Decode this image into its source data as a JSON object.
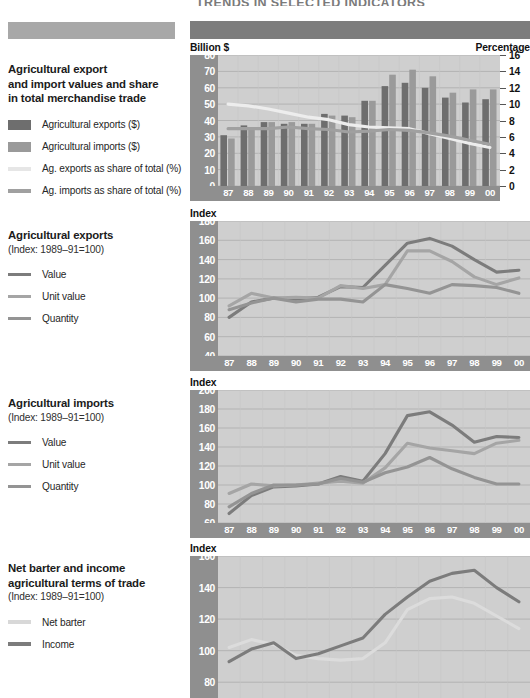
{
  "header": {
    "title": "TRENDS IN SELECTED INDICATORS"
  },
  "sections": [
    {
      "id": "trade-values",
      "title_lines": [
        "Agricultural export",
        "and import values and share",
        "in total merchandise trade"
      ],
      "subtitle": "",
      "legend": [
        {
          "label": "Agricultural exports ($)",
          "type": "box",
          "color": "#6e6e6e"
        },
        {
          "label": "Agricultural imports ($)",
          "type": "box",
          "color": "#9a9a9a"
        },
        {
          "label": "Ag. exports as share of total (%)",
          "type": "line",
          "color": "#e6e6e6"
        },
        {
          "label": "Ag. imports as share of total (%)",
          "type": "line",
          "color": "#a0a0a0"
        }
      ],
      "left_axis_caption": "Billion $",
      "right_axis_caption": "Percentage"
    },
    {
      "id": "ag-exports",
      "title_lines": [
        "Agricultural exports"
      ],
      "subtitle": "(Index: 1989–91=100)",
      "legend": [
        {
          "label": "Value",
          "type": "line",
          "color": "#7c7c7c"
        },
        {
          "label": "Unit value",
          "type": "line",
          "color": "#a5a5a5"
        },
        {
          "label": "Quantity",
          "type": "line",
          "color": "#949494"
        }
      ],
      "left_axis_caption": "Index",
      "right_axis_caption": ""
    },
    {
      "id": "ag-imports",
      "title_lines": [
        "Agricultural imports"
      ],
      "subtitle": "(Index: 1989–91=100)",
      "legend": [
        {
          "label": "Value",
          "type": "line",
          "color": "#7c7c7c"
        },
        {
          "label": "Unit value",
          "type": "line",
          "color": "#a5a5a5"
        },
        {
          "label": "Quantity",
          "type": "line",
          "color": "#949494"
        }
      ],
      "left_axis_caption": "Index",
      "right_axis_caption": ""
    },
    {
      "id": "terms-of-trade",
      "title_lines": [
        "Net barter and income",
        "agricultural terms of trade"
      ],
      "subtitle": "(Index: 1989–91=100)",
      "legend": [
        {
          "label": "Net barter",
          "type": "line",
          "color": "#d8d8d8"
        },
        {
          "label": "Income",
          "type": "line",
          "color": "#7c7c7c"
        }
      ],
      "left_axis_caption": "Index",
      "right_axis_caption": ""
    }
  ],
  "chart_data": [
    {
      "id": "trade-values",
      "type": "bar",
      "title": "Agricultural export and import values and share in total merchandise trade",
      "xlabel": "",
      "ylabel": "Billion $",
      "y2label": "Percentage",
      "categories": [
        "87",
        "88",
        "89",
        "90",
        "91",
        "92",
        "93",
        "94",
        "95",
        "96",
        "97",
        "98",
        "99",
        "00"
      ],
      "ylim": [
        0,
        80
      ],
      "yticks": [
        0,
        10,
        20,
        30,
        40,
        50,
        60,
        70,
        80
      ],
      "y2lim": [
        0,
        16
      ],
      "y2ticks": [
        0,
        2,
        4,
        6,
        8,
        10,
        12,
        14,
        16
      ],
      "grid": true,
      "series": [
        {
          "name": "Agricultural exports ($)",
          "kind": "bar",
          "color": "#6e6e6e",
          "values": [
            31,
            37,
            39,
            38,
            38,
            44,
            43,
            52,
            61,
            63,
            60,
            54,
            51,
            53
          ]
        },
        {
          "name": "Agricultural imports ($)",
          "kind": "bar",
          "color": "#9a9a9a",
          "values": [
            29,
            35,
            39,
            39,
            38,
            43,
            42,
            52,
            68,
            71,
            67,
            57,
            59,
            59
          ]
        },
        {
          "name": "Ag. exports as share of total (%)",
          "kind": "line",
          "color": "#ededed",
          "axis": "right",
          "values": [
            10.0,
            9.8,
            9.4,
            8.9,
            8.4,
            8.1,
            7.5,
            7.2,
            7.1,
            7.0,
            6.4,
            5.8,
            5.2,
            4.7
          ]
        },
        {
          "name": "Ag. imports as share of total (%)",
          "kind": "line",
          "color": "#a0a0a0",
          "axis": "right",
          "values": [
            7.0,
            7.0,
            7.0,
            7.2,
            7.0,
            6.9,
            6.6,
            6.7,
            6.9,
            6.8,
            6.5,
            6.1,
            5.6,
            5.1
          ]
        }
      ]
    },
    {
      "id": "ag-exports",
      "type": "line",
      "title": "Agricultural exports (Index: 1989-91=100)",
      "xlabel": "",
      "ylabel": "Index",
      "categories": [
        "87",
        "88",
        "89",
        "90",
        "91",
        "92",
        "93",
        "94",
        "95",
        "96",
        "97",
        "98",
        "99",
        "00"
      ],
      "ylim": [
        40,
        180
      ],
      "yticks": [
        40,
        60,
        80,
        100,
        120,
        140,
        160,
        180
      ],
      "grid": true,
      "series": [
        {
          "name": "Value",
          "color": "#7c7c7c",
          "values": [
            80,
            96,
            100,
            99,
            101,
            112,
            111,
            134,
            157,
            162,
            154,
            140,
            127,
            129
          ]
        },
        {
          "name": "Unit value",
          "color": "#a5a5a5",
          "values": [
            92,
            105,
            100,
            101,
            100,
            113,
            110,
            114,
            149,
            149,
            138,
            122,
            114,
            121
          ]
        },
        {
          "name": "Quantity",
          "color": "#949494",
          "values": [
            88,
            95,
            100,
            96,
            99,
            99,
            96,
            114,
            110,
            105,
            114,
            113,
            111,
            105
          ]
        }
      ]
    },
    {
      "id": "ag-imports",
      "type": "line",
      "title": "Agricultural imports (Index: 1989-91=100)",
      "xlabel": "",
      "ylabel": "Index",
      "categories": [
        "87",
        "88",
        "89",
        "90",
        "91",
        "92",
        "93",
        "94",
        "95",
        "96",
        "97",
        "98",
        "99",
        "00"
      ],
      "ylim": [
        60,
        200
      ],
      "yticks": [
        60,
        80,
        100,
        120,
        140,
        160,
        180,
        200
      ],
      "grid": true,
      "series": [
        {
          "name": "Value",
          "color": "#7c7c7c",
          "values": [
            70,
            89,
            98,
            99,
            101,
            109,
            104,
            133,
            173,
            177,
            163,
            145,
            151,
            150
          ]
        },
        {
          "name": "Unit value",
          "color": "#a5a5a5",
          "values": [
            91,
            101,
            99,
            100,
            102,
            104,
            102,
            118,
            144,
            139,
            136,
            133,
            144,
            147
          ]
        },
        {
          "name": "Quantity",
          "color": "#949494",
          "values": [
            77,
            91,
            100,
            100,
            101,
            107,
            103,
            113,
            119,
            129,
            117,
            108,
            101,
            101
          ]
        }
      ]
    },
    {
      "id": "terms-of-trade",
      "type": "line",
      "title": "Net barter and income agricultural terms of trade (Index: 1989-91=100)",
      "xlabel": "",
      "ylabel": "Index",
      "categories": [
        "87",
        "88",
        "89",
        "90",
        "91",
        "92",
        "93",
        "94",
        "95",
        "96",
        "97",
        "98",
        "99",
        "00"
      ],
      "ylim": [
        70,
        160
      ],
      "yticks": [
        80,
        100,
        120,
        140,
        160
      ],
      "grid": true,
      "series": [
        {
          "name": "Net barter",
          "color": "#dcdcdc",
          "values": [
            102,
            107,
            104,
            97,
            95,
            94,
            95,
            105,
            126,
            133,
            134,
            130,
            122,
            114
          ]
        },
        {
          "name": "Income",
          "color": "#7c7c7c",
          "values": [
            93,
            101,
            105,
            95,
            98,
            103,
            108,
            123,
            134,
            144,
            149,
            151,
            140,
            131
          ]
        }
      ]
    }
  ]
}
